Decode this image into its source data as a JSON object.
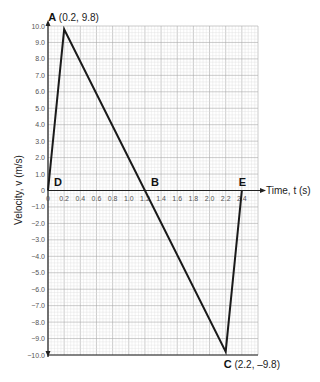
{
  "chart_data": {
    "type": "line",
    "title": "",
    "xlabel": "Time, t (s)",
    "ylabel": "Velocity, v (m/s)",
    "xlim": [
      0,
      2.6
    ],
    "ylim": [
      -10.0,
      10.0
    ],
    "grid": true,
    "x_ticks": [
      "0",
      "0.2",
      "0.4",
      "0.6",
      "0.8",
      "1.0",
      "1.2",
      "1.4",
      "1.6",
      "1.8",
      "2.0",
      "2.2",
      "2.4"
    ],
    "y_ticks": [
      "10.0",
      "9.0",
      "8.0",
      "7.0",
      "6.0",
      "5.0",
      "4.0",
      "3.0",
      "2.0",
      "1.0",
      "0",
      "-1.0",
      "-2.0",
      "-3.0",
      "-4.0",
      "-5.0",
      "-6.0",
      "-7.0",
      "-8.0",
      "-9.0",
      "-10.0"
    ],
    "series": [
      {
        "name": "velocity",
        "x": [
          0,
          0.2,
          1.2,
          2.2,
          2.4
        ],
        "y": [
          0,
          9.8,
          0,
          -9.8,
          0
        ]
      }
    ],
    "annotations": [
      {
        "label": "A",
        "coords": "(0.2, 9.8)",
        "x": 0.2,
        "y": 9.8
      },
      {
        "label": "B",
        "coords": "",
        "x": 1.2,
        "y": 0
      },
      {
        "label": "C",
        "coords": "(2.2, –9.8)",
        "x": 2.2,
        "y": -9.8
      },
      {
        "label": "D",
        "coords": "",
        "x": 0,
        "y": 0
      },
      {
        "label": "E",
        "coords": "",
        "x": 2.4,
        "y": 0
      }
    ]
  },
  "colors": {
    "line": "#1a1a1a",
    "grid_minor": "#dddddd",
    "grid_major": "#aaaaaa",
    "axis": "#222222"
  }
}
